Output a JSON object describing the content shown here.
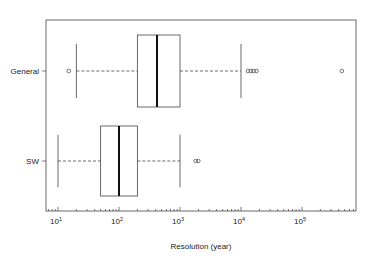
{
  "chart_data": {
    "type": "boxplot",
    "orientation": "horizontal",
    "title": "",
    "xlabel": "Resolution (year)",
    "ylabel": "",
    "xscale": "log",
    "xlim": [
      7,
      700000
    ],
    "xticks": [
      {
        "base": "10",
        "exp": "1",
        "value": 10
      },
      {
        "base": "10",
        "exp": "2",
        "value": 100
      },
      {
        "base": "10",
        "exp": "3",
        "value": 1000
      },
      {
        "base": "10",
        "exp": "4",
        "value": 10000
      },
      {
        "base": "10",
        "exp": "5",
        "value": 100000
      }
    ],
    "grid": false,
    "legend": null,
    "categories": [
      "General",
      "SW"
    ],
    "series": [
      {
        "name": "General",
        "whisker_low": 20,
        "q1": 200,
        "median": 420,
        "q3": 1000,
        "whisker_high": 10000,
        "outliers": [
          15,
          13000,
          14500,
          16000,
          18000,
          450000
        ]
      },
      {
        "name": "SW",
        "whisker_low": 10,
        "q1": 50,
        "median": 100,
        "q3": 200,
        "whisker_high": 1000,
        "outliers": [
          1800,
          2000
        ]
      }
    ]
  },
  "colors": {
    "frame": "#444444",
    "box": "#444444",
    "median": "#111111",
    "background": "#ffffff"
  }
}
